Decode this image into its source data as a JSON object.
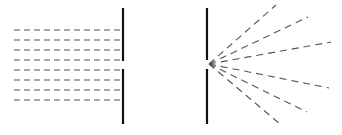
{
  "diagram": {
    "colors": {
      "barrier": "#111111",
      "wave": "#555555",
      "background": "#ffffff"
    },
    "left_panel": {
      "label": "incoming-plane-waves",
      "barrier": {
        "x": 123,
        "top": [
          8,
          61
        ],
        "bottom": [
          69,
          124
        ]
      },
      "wave_lines_y": [
        30,
        40,
        50,
        60,
        70,
        80,
        90,
        100
      ],
      "wave_x_start": 14,
      "wave_x_end": 122
    },
    "right_panel": {
      "label": "diffracted-rays",
      "barrier": {
        "x": 207,
        "top": [
          8,
          60
        ],
        "bottom": [
          69,
          124
        ]
      },
      "origin": [
        209,
        64
      ],
      "ray_endpoints": [
        [
          276,
          5
        ],
        [
          308,
          17
        ],
        [
          331,
          42
        ],
        [
          329,
          88
        ],
        [
          307,
          112
        ],
        [
          280,
          124
        ]
      ]
    }
  }
}
